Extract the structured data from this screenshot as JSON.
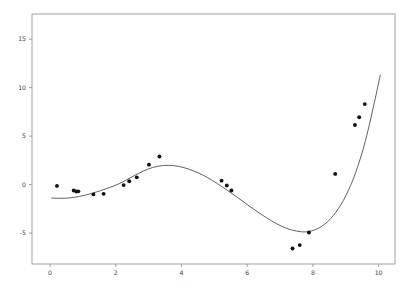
{
  "chart_data": {
    "type": "scatter",
    "title": "",
    "subtitle": "",
    "xlabel": "",
    "ylabel": "",
    "xlim": [
      -0.55,
      10.5
    ],
    "ylim": [
      -8.2,
      17.6
    ],
    "xticks": [
      0,
      2,
      4,
      6,
      8,
      10
    ],
    "xticklabels": [
      "0",
      "2",
      "4",
      "6",
      "8",
      "10"
    ],
    "yticks": [
      -5,
      0,
      5,
      10,
      15
    ],
    "yticklabels": [
      "-5",
      "0",
      "5",
      "10",
      "15"
    ],
    "grid": false,
    "legend": false,
    "legend_position": "none",
    "background": "#ffffff",
    "series": [
      {
        "name": "observations",
        "type": "scatter",
        "marker": "circle",
        "color": "#111111",
        "marker_size": 3,
        "x": [
          0.21,
          0.72,
          0.8,
          0.86,
          1.32,
          1.63,
          2.24,
          2.41,
          2.64,
          3.01,
          3.33,
          5.22,
          5.38,
          5.52,
          7.38,
          7.6,
          7.88,
          8.68,
          9.28,
          9.41,
          9.58
        ],
        "y": [
          -0.14,
          -0.62,
          -0.72,
          -0.7,
          -1.02,
          -0.96,
          -0.06,
          0.34,
          0.74,
          2.05,
          2.9,
          0.4,
          -0.1,
          -0.62,
          -6.6,
          -6.25,
          -4.95,
          1.1,
          6.15,
          6.95,
          8.3
        ]
      },
      {
        "name": "fitted-curve",
        "type": "line",
        "color": "#4f4f54",
        "linewidth": 0.9,
        "x": [
          0.05,
          0.3,
          0.6,
          0.9,
          1.2,
          1.5,
          1.8,
          2.1,
          2.4,
          2.7,
          3.0,
          3.3,
          3.6,
          3.9,
          4.2,
          4.5,
          4.8,
          5.1,
          5.4,
          5.7,
          6.0,
          6.3,
          6.6,
          6.9,
          7.2,
          7.5,
          7.8,
          8.1,
          8.4,
          8.7,
          9.0,
          9.3,
          9.6,
          9.9,
          10.05
        ],
        "y": [
          -1.4,
          -1.42,
          -1.38,
          -1.22,
          -0.98,
          -0.68,
          -0.32,
          0.08,
          0.62,
          1.16,
          1.62,
          1.9,
          1.98,
          1.88,
          1.62,
          1.22,
          0.7,
          0.08,
          -0.6,
          -1.32,
          -2.06,
          -2.78,
          -3.45,
          -4.05,
          -4.52,
          -4.8,
          -4.88,
          -4.62,
          -3.98,
          -2.86,
          -1.18,
          1.22,
          4.52,
          8.9,
          11.3
        ]
      }
    ]
  },
  "axes": {
    "frame_color": "#8a8a8a",
    "tick_color": "#8a8a8a",
    "label_color": "#3a3a3a"
  }
}
